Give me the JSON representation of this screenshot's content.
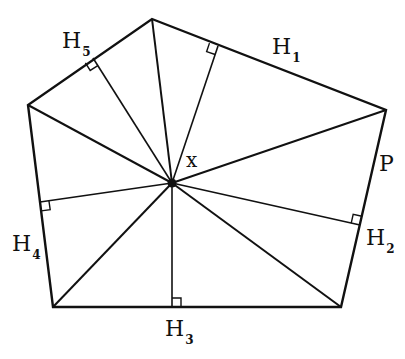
{
  "figure": {
    "width": 405,
    "height": 359,
    "background": "#ffffff",
    "stroke_color": "#111111"
  },
  "pentagon": {
    "vertices": [
      {
        "x": 152,
        "y": 19
      },
      {
        "x": 386,
        "y": 110
      },
      {
        "x": 341,
        "y": 307
      },
      {
        "x": 53,
        "y": 307
      },
      {
        "x": 28,
        "y": 105
      }
    ]
  },
  "center": {
    "x": 172,
    "y": 183,
    "label": "x"
  },
  "feet": [
    {
      "name": "H1",
      "x": 218,
      "y": 46
    },
    {
      "name": "H2",
      "x": 360,
      "y": 225
    },
    {
      "name": "H3",
      "x": 172,
      "y": 307
    },
    {
      "name": "H4",
      "x": 40,
      "y": 202
    },
    {
      "name": "H5",
      "x": 93,
      "y": 58
    }
  ],
  "labels": {
    "h1": {
      "main": "H",
      "sub": "1",
      "x": 272,
      "y": 36
    },
    "h2": {
      "main": "H",
      "sub": "2",
      "x": 366,
      "y": 227
    },
    "h3": {
      "main": "H",
      "sub": "3",
      "x": 165,
      "y": 318
    },
    "h4": {
      "main": "H",
      "sub": "4",
      "x": 12,
      "y": 233
    },
    "h5": {
      "main": "H",
      "sub": "5",
      "x": 62,
      "y": 30
    },
    "p": {
      "text": "P",
      "x": 379,
      "y": 153
    },
    "x": {
      "text": "x",
      "x": 186,
      "y": 150
    }
  }
}
